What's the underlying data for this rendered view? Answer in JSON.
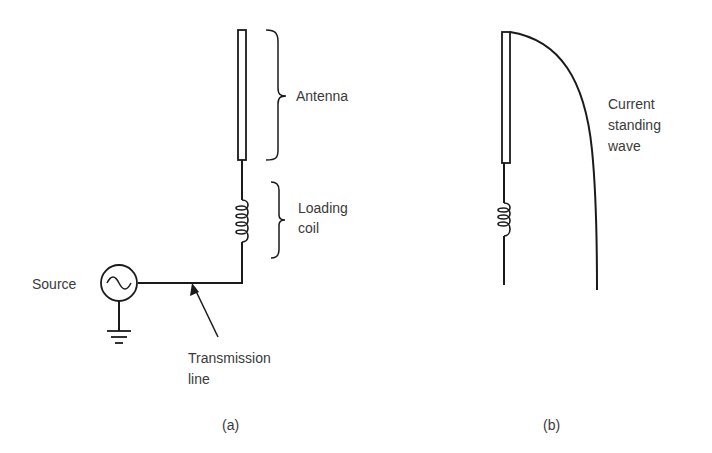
{
  "figure_a": {
    "caption": "(a)",
    "labels": {
      "antenna": "Antenna",
      "loading_coil_line1": "Loading",
      "loading_coil_line2": "coil",
      "source": "Source",
      "transmission_line1": "Transmission",
      "transmission_line2": "line"
    }
  },
  "figure_b": {
    "caption": "(b)",
    "labels": {
      "wave_line1": "Current",
      "wave_line2": "standing",
      "wave_line3": "wave"
    }
  },
  "colors": {
    "stroke": "#1a1a1a",
    "text": "#3a3a3a",
    "background": "#ffffff"
  }
}
